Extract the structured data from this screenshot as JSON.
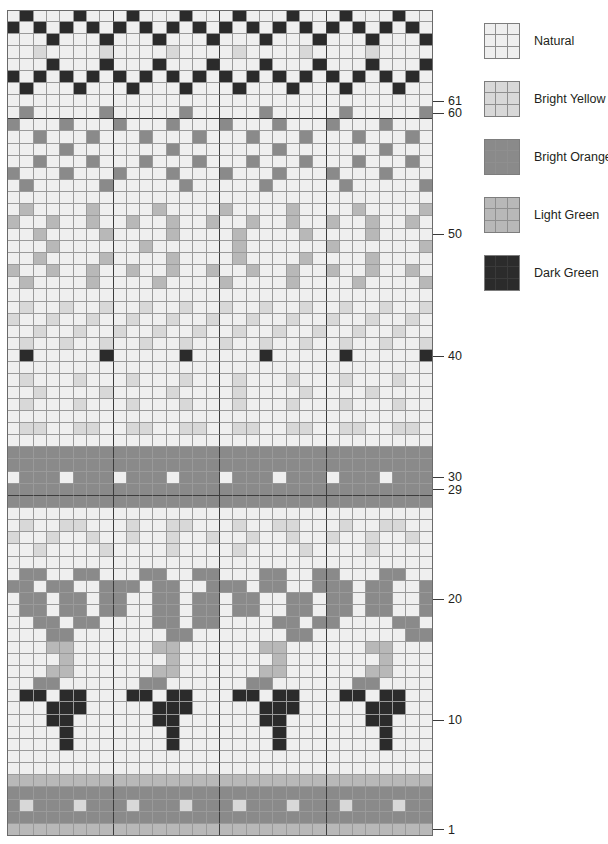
{
  "chart_title": "Colorwork Knitting Chart",
  "legend": {
    "items": [
      {
        "name": "Natural",
        "label": "Natural",
        "color": "#efefef"
      },
      {
        "name": "Bright Yellow",
        "label": "Bright Yellow",
        "color": "#d8d8d8"
      },
      {
        "name": "Bright Orange",
        "label": "Bright Orange",
        "color": "#8a8a8a"
      },
      {
        "name": "Light Green",
        "label": "Light Green",
        "color": "#b8b8b8"
      },
      {
        "name": "Dark Green",
        "label": "Dark Green",
        "color": "#2b2b2b"
      }
    ]
  },
  "chart_data": {
    "type": "heatmap",
    "xlabel": "",
    "ylabel": "Row",
    "columns": 32,
    "rows": 61,
    "grid": true,
    "legend_position": "right",
    "row_direction": "bottom-to-top",
    "repeat_columns": [
      8,
      16,
      24
    ],
    "repeat_rows": [
      29,
      60
    ],
    "palette": {
      "N": "#efefef",
      "Y": "#d8d8d8",
      "O": "#8a8a8a",
      "L": "#b8b8b8",
      "D": "#2b2b2b"
    },
    "palette_names": {
      "N": "Natural",
      "Y": "Bright Yellow",
      "O": "Bright Orange",
      "L": "Light Green",
      "D": "Dark Green"
    },
    "row_labels": [
      {
        "row": 61,
        "label": "61"
      },
      {
        "row": 60,
        "label": "60"
      },
      {
        "row": 50,
        "label": "50"
      },
      {
        "row": 40,
        "label": "40"
      },
      {
        "row": 30,
        "label": "30"
      },
      {
        "row": 29,
        "label": "29"
      },
      {
        "row": 20,
        "label": "20"
      },
      {
        "row": 10,
        "label": "10"
      },
      {
        "row": 1,
        "label": "1"
      }
    ],
    "rows_top_to_bottom": [
      "NDNNNDNNNDNNNDNNNDNNNDNNNDNNNDNN",
      "DNDNDNDNDNDNDNDNDNDNDNDNDNDNDNDN",
      "NNNDNNNDNNNDNNNDNNNDNNNDNNNDNNND",
      "NNYNNNNYNNNNYNNNNYNNNNYNNNNYNNNN",
      "NNNDNNNDNNNDNNNDNNNDNNNDNNNDNNND",
      "DNDNDNDNDNDNDNDNDNDNDNDNDNDNDNDN",
      "NDNNNDNNNDNNNDNNNDNNNDNNNDNNNDNN",
      "NNNNNNNNNNNNNNNNNNNNNNNNNNNNNNNN",
      "NONNNNNONNNNNONNNNNONNNNNONNNNNO",
      "ONNNONNNONNNONNNONNNONNNONNNONNN",
      "NNONNNONNNONNNONNNONNNONNNONNNON",
      "NNNNONNNNNNNONNNNNNNONNNNNNNONNN",
      "NNONNNONNNONNNONNNONNNONNNONNNON",
      "ONNNONNNONNNONNNONNNONNNONNNONNN",
      "NONNNNNONNNNNONNNNNONNNNNONNNNNO",
      "NNNNNNNNNNNNNNNNNNNNNNNNNNNNNNNN",
      "NLNNNNLNNNNLNNNNLNNNNLNNNNLNNNNL",
      "LNNLNNLNNLNNLNNLNNLNNLNNLNNLNNLN",
      "NNLNNNNLNNNNLNNNNLNNNNLNNNNLNNNN",
      "NNNLNNNNNNLNNNNNNLNNNNNNLNNNNNNL",
      "NNLNNNNLNNNNLNNNNLNNNNLNNNNLNNNN",
      "LNNLNNLNNLNNLNNLNNLNNLNNLNNLNNLN",
      "NLNNNNLNNNNLNNNNLNNNNLNNNNLNNNNL",
      "NNNNNNNNNNNNNNNNNNNNNNNNNNNNNNNN",
      "NYNNYNNYNNYNNYNNYNNYNNYNNYNNYNNY",
      "YNNYNNYNNYNNYNNYNNYNNYNNYNNYNNYN",
      "NNYNNYNNYNNYNNYNNYNNYNNYNNYNNYNN",
      "NYNNYNNYNNYNNYNNYNNYNNYNNYNNYNNY",
      "NDNNNNNDNNNNNDNNNNNDNNNNNDNNNNND",
      "NNNNNNNNNNNNNNNNNNNNNNNNNNNNNNNN",
      "NYNNNYNNNYNNNYNNNYNNNYNNNYNNNYNN",
      "NNYNNNNYNNNNYNNNNYNNNNYNNNNYNNNN",
      "NYNNNYNNNYNNNYNNNYNNNYNNNYNNNYNN",
      "NNNNNNNNNNNNNNNNNNNNNNNNNNNNNNNN",
      "NYYNNYYNNYYNNYYNNYYNNYYNNYYNNYYN",
      "NNNNNNNNNNNNNNNNNNNNNNNNNNNNNNNN",
      "OOOOOOOOOOOOOOOOOOOOOOOOOOOOOOOO",
      "OOOOOOOOOOOOOOOOOOOOOOOOOOOOOOOO",
      "NOOONOOONOOONOOONOOONOOONOOONOOO",
      "OOOOOOOOOOOOOOOOOOOOOOOOOOOOOOOO",
      "OOOOOOOOOOOOOOOOOOOOOOOOOOOOOOOO",
      "NNNNNNNNNNNNNNNNNNNNNNNNNNNNNNNN",
      "NYNNYYNNNYNNYYNNNYNNYYNNNYNNYYNN",
      "YNNYNNYNNYNNYNNYNNYNNYNNYNNYNNYN",
      "NNYNNNNYNNNNYNNNNYNNNNYNNNNYNNNN",
      "NNNNNNNNNNNNNNNNNNNNNNNNNNNNNNNN",
      "NOONNOONNNOONNOONNNOONNOONNNOONN",
      "OONOONNOOONOONNOOONOONNOOONOONNO",
      "NOONOONOONNOONOONOONNOONOONOONNO",
      "NOONOONOONNOONOONOONNOONOONOONNO",
      "NNOONOONNNNOONOONNNNOONOONNNNOON",
      "NNNOONNNNNNNOONNNNNNNOONNNNNNNOO",
      "NNNLLNNNNNNLLNNNNNNLLNNNNNNLLNNN",
      "NNNNLNNNNNNNLNNNNNNNLNNNNNNNLNNN",
      "NNNLLNNNNNNLLNNNNNNLLNNNNNNLLNNN",
      "NNOONNNNNNOONNNNNNOONNNNNNOONNNN",
      "NDDNDDNNNDDNDDNNNDDNDDNNNDDNDDNN",
      "NNNDDDNNNNNDDDNNNNNDDDNNNNNDDDNN",
      "NNNDDNNNNNNDDNNNNNNDDNNNNNNDDNNN",
      "NNNNDNNNNNNNDNNNNNNNDNNNNNNNDNNN",
      "NNNNDNNNNNNNDNNNNNNNDNNNNNNNDNNN",
      "NNNNNNNNNNNNNNNNNNNNNNNNNNNNNNNN",
      "NNNNNNNNNNNNNNNNNNNNNNNNNNNNNNNN",
      "LLLLLLLLLLLLLLLLLLLLLLLLLLLLLLLL",
      "OOOOOOOOOOOOOOOOOOOOOOOOOOOOOOOO",
      "OYOOOYOOOYOOOYOOOYOOOYOOOYOOOYOO",
      "OOOOOOOOOOOOOOOOOOOOOOOOOOOOOOOO",
      "LLLLLLLLLLLLLLLLLLLLLLLLLLLLLLLL"
    ]
  }
}
